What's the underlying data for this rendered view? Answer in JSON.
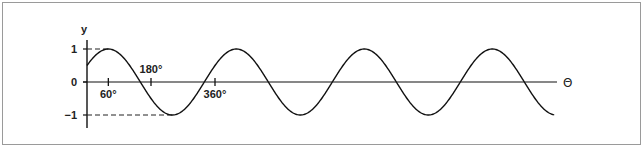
{
  "chart_data": {
    "type": "line",
    "title": "",
    "xlabel": "Θ",
    "ylabel": "y",
    "function": "y = sin(θ + 30°)",
    "phase_deg": 30,
    "amplitude": 1,
    "xlim_deg": [
      0,
      1315
    ],
    "ylim": [
      -1,
      1
    ],
    "x_ticks": [
      {
        "value": 60,
        "label": "60°",
        "label_pos": "below"
      },
      {
        "value": 180,
        "label": "180°",
        "label_pos": "above"
      },
      {
        "value": 360,
        "label": "360°",
        "label_pos": "below"
      }
    ],
    "y_ticks": [
      {
        "value": 1,
        "label": "1"
      },
      {
        "value": 0,
        "label": "0"
      },
      {
        "value": -1,
        "label": "-1"
      }
    ],
    "reference_lines": [
      {
        "y": 1,
        "to_x_deg": 60,
        "style": "dashed"
      },
      {
        "y": -1,
        "to_x_deg": 240,
        "style": "dashed"
      }
    ],
    "line_color": "#111111",
    "grid": false
  }
}
